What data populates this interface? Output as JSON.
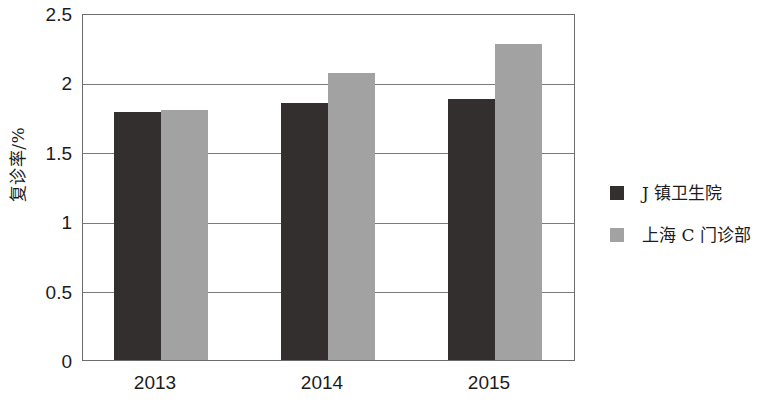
{
  "chart_data": {
    "type": "bar",
    "title": "",
    "xlabel": "",
    "ylabel": "复诊率/%",
    "categories": [
      "2013",
      "2014",
      "2015"
    ],
    "series": [
      {
        "name": "J 镇卫生院",
        "color": "#332f2e",
        "values": [
          1.79,
          1.85,
          1.88
        ]
      },
      {
        "name": "上海 C 门诊部",
        "color": "#a2a2a2",
        "values": [
          1.8,
          2.07,
          2.28
        ]
      }
    ],
    "ylim": [
      0,
      2.5
    ],
    "yticks": [
      "0",
      "0.5",
      "1",
      "1.5",
      "2",
      "2.5"
    ],
    "ytick_values": [
      0,
      0.5,
      1,
      1.5,
      2,
      2.5
    ],
    "grid": true,
    "grid_axis": "y",
    "legend_position": "right"
  },
  "axis": {
    "y_title": "复诊率/%"
  },
  "legend": {
    "items": [
      {
        "label": "J 镇卫生院"
      },
      {
        "label": "上海 C 门诊部"
      }
    ]
  }
}
